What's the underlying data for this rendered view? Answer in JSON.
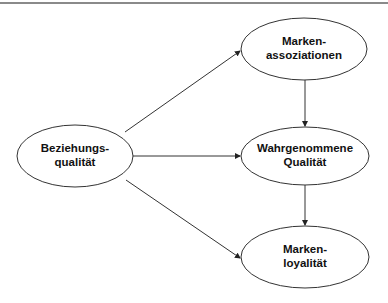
{
  "diagram": {
    "nodes": [
      {
        "id": "beziehungsqualitaet",
        "lines": [
          "Beziehungs-",
          "qualität"
        ],
        "cx": 75,
        "cy": 156,
        "rx": 58,
        "ry": 31
      },
      {
        "id": "markenassoziationen",
        "lines": [
          "Marken-",
          "assoziationen"
        ],
        "cx": 304,
        "cy": 49,
        "rx": 63,
        "ry": 31
      },
      {
        "id": "wahrgenommene-qualitaet",
        "lines": [
          "Wahrgenommene",
          "Qualität"
        ],
        "cx": 305,
        "cy": 156,
        "rx": 64,
        "ry": 29
      },
      {
        "id": "markenloyalitaet",
        "lines": [
          "Marken-",
          "loyalität"
        ],
        "cx": 305,
        "cy": 257,
        "rx": 64,
        "ry": 31
      }
    ],
    "edges": [
      {
        "from": "beziehungsqualitaet",
        "to": "markenassoziationen"
      },
      {
        "from": "beziehungsqualitaet",
        "to": "wahrgenommene-qualitaet"
      },
      {
        "from": "beziehungsqualitaet",
        "to": "markenloyalitaet"
      },
      {
        "from": "markenassoziationen",
        "to": "wahrgenommene-qualitaet"
      },
      {
        "from": "wahrgenommene-qualitaet",
        "to": "markenloyalitaet"
      }
    ],
    "colors": {
      "stroke": "#333333",
      "text": "#111111",
      "rule": "#8a8a8a"
    }
  }
}
